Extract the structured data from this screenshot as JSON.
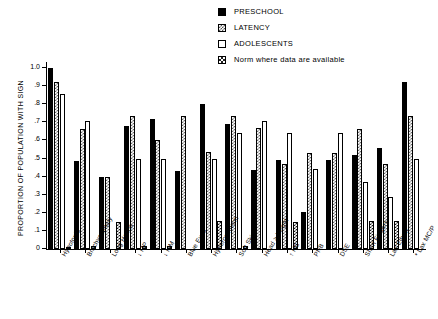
{
  "chart_data": {
    "type": "bar",
    "title": "",
    "xlabel": "",
    "ylabel": "PROPORTION OF POPULATION WITH SIGN",
    "ylim": [
      0,
      1.0
    ],
    "grid": false,
    "legend_position": "top-right",
    "ytick_labels": [
      "0",
      ".1",
      ".2",
      ".3",
      ".4",
      ".5",
      ".6",
      ".7",
      ".8",
      ".9",
      "1.0"
    ],
    "ytick_values": [
      0,
      0.1,
      0.2,
      0.3,
      0.4,
      0.5,
      0.6,
      0.7,
      0.8,
      0.9,
      1.0
    ],
    "categories": [
      "Hypotonia",
      "Brachycephaly",
      "Long Hands",
      "↓ MP",
      "↓ MM",
      "Blue Eyes",
      "Hypercanthism",
      "Soft Skin",
      "Head > height",
      "↑ HC",
      "PNB",
      "DSE",
      "Short Fingers",
      "Lax Elbow",
      "* Lax MC/P"
    ],
    "series": [
      {
        "name": "PRESCHOOL",
        "values": [
          1.0,
          0.485,
          0.4,
          0.68,
          0.72,
          0.43,
          0.8,
          0.69,
          0.435,
          0.49,
          0.205,
          0.49,
          0.52,
          0.56,
          0.92
        ]
      },
      {
        "name": "LATENCY",
        "values": [
          0.92,
          0.665,
          0.4,
          0.735,
          0.6,
          0.735,
          0.535,
          0.735,
          0.67,
          0.47,
          0.53,
          0.53,
          0.665,
          0.47,
          0.735
        ]
      },
      {
        "name": "ADOLESCENTS",
        "values": [
          0.855,
          0.71,
          0.0,
          0.5,
          0.5,
          0.0,
          0.5,
          0.64,
          0.71,
          0.64,
          0.44,
          0.64,
          0.37,
          0.29,
          0.5
        ]
      },
      {
        "name": "Norm where data are available",
        "values": [
          0.01,
          0.015,
          0.15,
          0.015,
          0.015,
          0.0,
          0.155,
          0.015,
          0.0,
          0.15,
          0.0,
          0.0,
          0.155,
          0.155,
          0.0
        ]
      }
    ]
  },
  "legend": {
    "entries": [
      {
        "label": "PRESCHOOL",
        "swatch": "preschool",
        "color": "#000000"
      },
      {
        "label": "LATENCY",
        "swatch": "latency",
        "color": "#6a6a6a"
      },
      {
        "label": "ADOLESCENTS",
        "swatch": "adolescents",
        "color": "#ffffff"
      },
      {
        "label": "Norm where data are available",
        "swatch": "norm",
        "color": "#1a1a1a"
      }
    ]
  }
}
